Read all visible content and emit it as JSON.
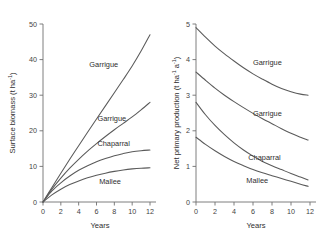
{
  "figure": {
    "background_color": "#ffffff",
    "curve_color": "#5a5a5a",
    "axis_color": "#6f6f6f"
  },
  "chart_data": [
    {
      "type": "line",
      "panel": "left",
      "title": "",
      "xlabel": "Years",
      "ylabel": "Surface biomass (t ha⁻¹)",
      "ylabel_base": "Surface biomass (t ha",
      "ylabel_sup": "-1",
      "ylabel_tail": ")",
      "xlim": [
        0,
        12
      ],
      "ylim": [
        0,
        50
      ],
      "grid": false,
      "legend": "inline-curve-labels",
      "xticks": [
        0,
        2,
        4,
        6,
        8,
        10,
        12
      ],
      "xtick_labels": [
        "0",
        "2",
        "4",
        "6",
        "8",
        "10",
        "12"
      ],
      "yticks": [
        0,
        10,
        20,
        30,
        40,
        50
      ],
      "ytick_labels": [
        "0",
        "10",
        "20",
        "30",
        "40",
        "50"
      ],
      "x": [
        0,
        1,
        2,
        3,
        4,
        5,
        6,
        7,
        8,
        9,
        10,
        11,
        12
      ],
      "series": [
        {
          "name": "Garrigue",
          "label": "Garrigue",
          "label_x": 5.2,
          "label_y": 38.0,
          "values": [
            0,
            4.1,
            8.1,
            12.0,
            15.8,
            19.6,
            23.3,
            27.0,
            30.7,
            34.4,
            38.2,
            42.4,
            47.0
          ]
        },
        {
          "name": "Garrigue-2",
          "label": "Garrigue",
          "label_x": 6.1,
          "label_y": 22.7,
          "values": [
            0,
            3.6,
            6.7,
            9.5,
            12.0,
            14.3,
            16.4,
            18.4,
            20.3,
            22.1,
            23.9,
            25.9,
            28.0
          ]
        },
        {
          "name": "Chaparral",
          "label": "Chaparral",
          "label_x": 6.1,
          "label_y": 15.6,
          "values": [
            0,
            3.1,
            5.4,
            7.3,
            8.9,
            10.2,
            11.3,
            12.2,
            13.0,
            13.6,
            14.1,
            14.4,
            14.6
          ]
        },
        {
          "name": "Mallee",
          "label": "Mallee",
          "label_x": 6.3,
          "label_y": 5.0,
          "values": [
            0,
            2.0,
            3.6,
            4.9,
            5.9,
            6.8,
            7.5,
            8.1,
            8.6,
            9.0,
            9.3,
            9.5,
            9.6
          ]
        }
      ]
    },
    {
      "type": "line",
      "panel": "right",
      "title": "",
      "xlabel": "Years",
      "ylabel": "Net primary production (t ha⁻¹ a⁻¹)",
      "ylabel_base": "Net primary production (t ha",
      "ylabel_sup": "-1",
      "ylabel_mid": " a",
      "ylabel_sup2": "-1",
      "ylabel_tail": ")",
      "xlim": [
        0,
        12
      ],
      "ylim": [
        0,
        5
      ],
      "grid": false,
      "legend": "inline-curve-labels",
      "xticks": [
        0,
        2,
        4,
        6,
        8,
        10,
        12
      ],
      "xtick_labels": [
        "0",
        "2",
        "4",
        "6",
        "8",
        "10",
        "12"
      ],
      "yticks": [
        0,
        1,
        2,
        3,
        4,
        5
      ],
      "ytick_labels": [
        "0",
        "1",
        "2",
        "3",
        "4",
        "5"
      ],
      "x": [
        0,
        1,
        2,
        3,
        4,
        5,
        6,
        7,
        8,
        9,
        10,
        11,
        11.8
      ],
      "series": [
        {
          "name": "Garrigue",
          "label": "Garrigue",
          "label_x": 6.0,
          "label_y": 3.85,
          "values": [
            4.9,
            4.63,
            4.38,
            4.16,
            3.96,
            3.77,
            3.6,
            3.45,
            3.31,
            3.19,
            3.1,
            3.03,
            3.0
          ]
        },
        {
          "name": "Garrigue-2",
          "label": "Garrigue",
          "label_x": 6.0,
          "label_y": 2.42,
          "values": [
            3.65,
            3.42,
            3.2,
            3.0,
            2.82,
            2.65,
            2.49,
            2.34,
            2.2,
            2.06,
            1.93,
            1.82,
            1.74
          ]
        },
        {
          "name": "Chaparral",
          "label": "Chaparral",
          "label_x": 5.5,
          "label_y": 1.18,
          "values": [
            2.8,
            2.45,
            2.15,
            1.89,
            1.66,
            1.46,
            1.29,
            1.14,
            1.02,
            0.91,
            0.8,
            0.7,
            0.62
          ]
        },
        {
          "name": "Mallee",
          "label": "Mallee",
          "label_x": 5.3,
          "label_y": 0.54,
          "values": [
            1.82,
            1.62,
            1.44,
            1.28,
            1.14,
            1.02,
            0.91,
            0.82,
            0.74,
            0.66,
            0.58,
            0.5,
            0.44
          ]
        }
      ]
    }
  ]
}
